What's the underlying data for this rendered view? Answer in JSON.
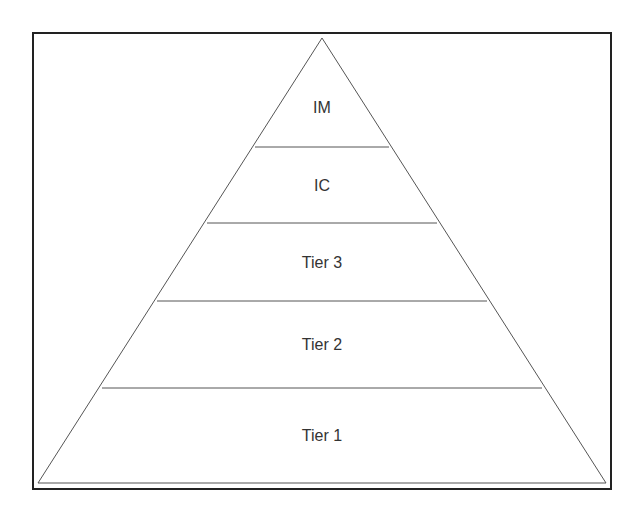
{
  "diagram": {
    "type": "pyramid",
    "levels_top_to_bottom": [
      {
        "label": "IM"
      },
      {
        "label": "IC"
      },
      {
        "label": "Tier 3"
      },
      {
        "label": "Tier 2"
      },
      {
        "label": "Tier 1"
      }
    ]
  }
}
